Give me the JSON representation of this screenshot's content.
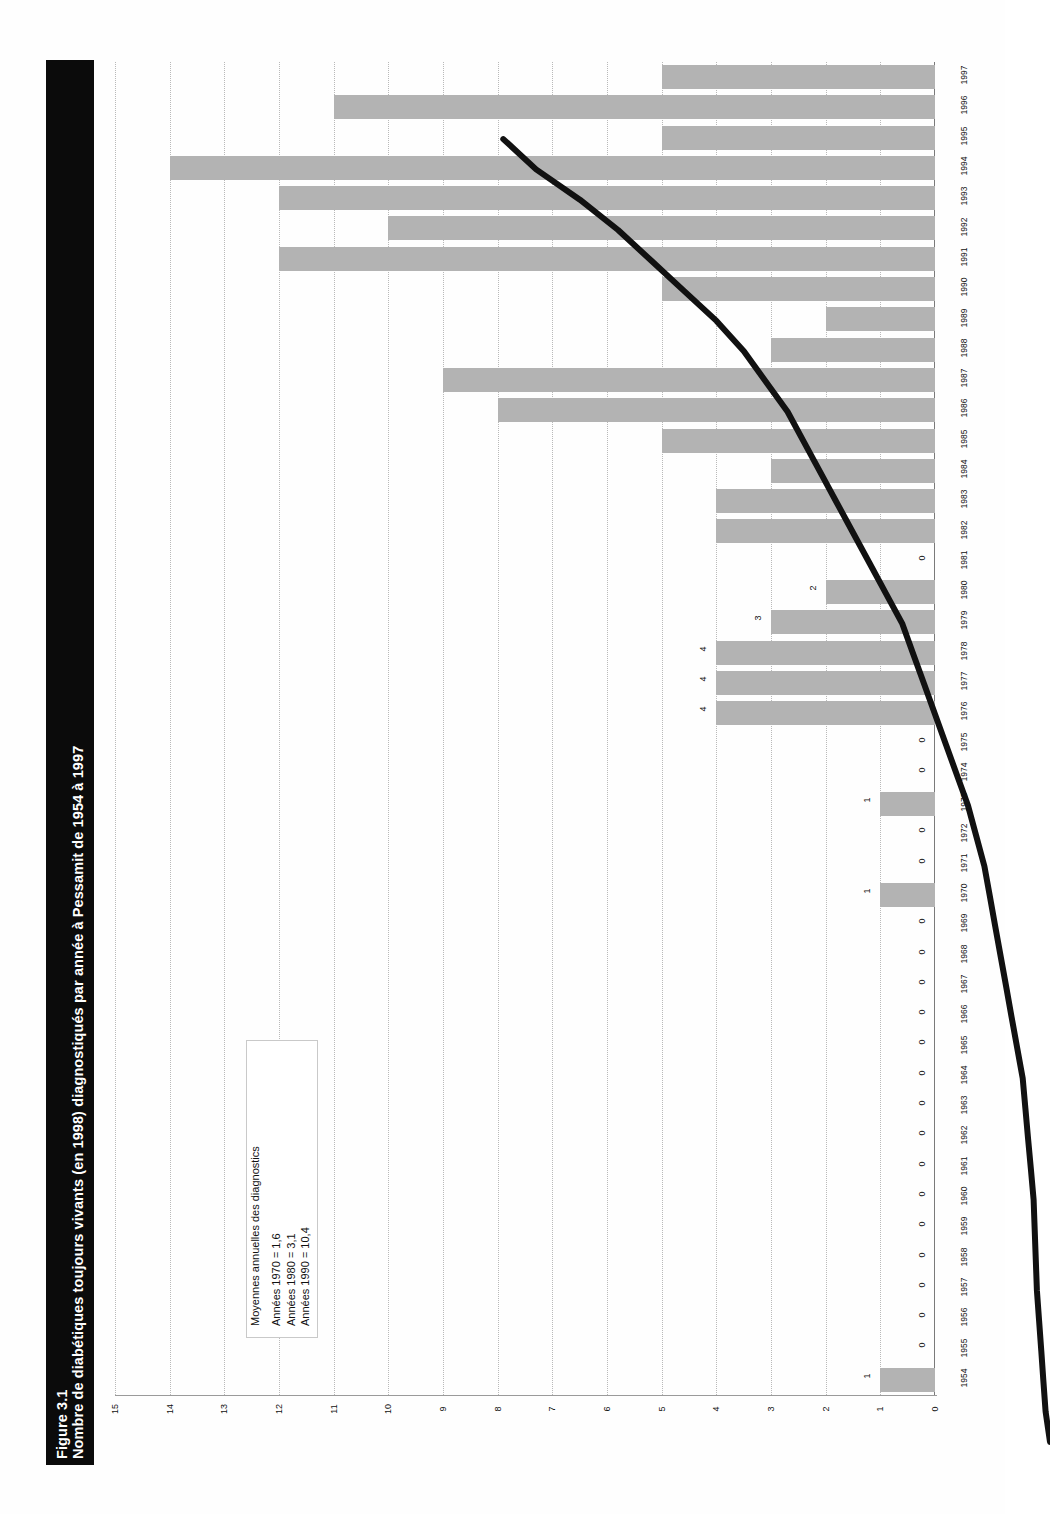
{
  "figure": {
    "number": "Figure 3.1",
    "caption": "Nombre de diabétiques toujours vivants (en 1998) diagnostiqués par année à Pessamit de 1954 à 1997"
  },
  "note": {
    "heading": "Moyennes annuelles des diagnostics",
    "lines": [
      "Années 1970 = 1,6",
      "Années 1980 = 3,1",
      "Années 1990 = 10,4"
    ]
  },
  "colors": {
    "bar": "#b3b3b3",
    "line": "#111111",
    "grid": "#b9b9b9",
    "title_band": "#0b0b0b",
    "title_text": "#ffffff"
  },
  "chart_data": {
    "type": "bar",
    "title": "Nombre de diabétiques toujours vivants (en 1998) diagnostiqués par année à Pessamit de 1954 à 1997",
    "xlabel": "",
    "ylabel": "",
    "orientation": "horizontal",
    "value_axis_ticks": [
      "15",
      "14",
      "13",
      "12",
      "11",
      "10",
      "9",
      "8",
      "7",
      "6",
      "5",
      "4",
      "3",
      "2",
      "1",
      "0"
    ],
    "value_axis_range": [
      0,
      15
    ],
    "grid": true,
    "legend": "none",
    "categories": [
      "1997",
      "1996",
      "1995",
      "1994",
      "1993",
      "1992",
      "1991",
      "1990",
      "1989",
      "1988",
      "1987",
      "1986",
      "1985",
      "1984",
      "1983",
      "1982",
      "1981",
      "1980",
      "1979",
      "1978",
      "1977",
      "1976",
      "1975",
      "1974",
      "1973",
      "1972",
      "1971",
      "1970",
      "1969",
      "1968",
      "1967",
      "1966",
      "1965",
      "1964",
      "1963",
      "1962",
      "1961",
      "1960",
      "1959",
      "1958",
      "1957",
      "1956",
      "1955",
      "1954"
    ],
    "values": [
      5,
      11,
      5,
      14,
      12,
      10,
      12,
      5,
      2,
      3,
      9,
      8,
      5,
      3,
      4,
      4,
      0,
      2,
      3,
      4,
      4,
      4,
      0,
      0,
      1,
      0,
      0,
      1,
      0,
      0,
      0,
      0,
      0,
      0,
      0,
      0,
      0,
      0,
      0,
      0,
      0,
      0,
      0,
      1
    ],
    "point_labels": [
      "",
      "",
      "",
      "",
      "",
      "",
      "",
      "",
      "",
      "",
      "",
      "",
      "",
      "",
      "",
      "",
      "0",
      "2",
      "3",
      "4",
      "4",
      "4",
      "0",
      "0",
      "1",
      "0",
      "0",
      "1",
      "0",
      "0",
      "0",
      "0",
      "0",
      "0",
      "0",
      "0",
      "0",
      "0",
      "0",
      "0",
      "0",
      "0",
      "0",
      "1"
    ],
    "series": [
      {
        "name": "Nombre de diabétiques toujours vivants",
        "type": "bar",
        "values": [
          5,
          11,
          5,
          14,
          12,
          10,
          12,
          5,
          2,
          3,
          9,
          8,
          5,
          3,
          4,
          4,
          0,
          2,
          3,
          4,
          4,
          4,
          0,
          0,
          1,
          0,
          0,
          1,
          0,
          0,
          0,
          0,
          0,
          0,
          0,
          0,
          0,
          0,
          0,
          0,
          0,
          0,
          0,
          1
        ]
      },
      {
        "name": "Courbe cumulative (tendance)",
        "type": "line",
        "values": [
          10.0,
          9.4,
          8.6,
          7.9,
          7.3,
          6.7,
          6.1,
          5.6,
          5.2,
          4.8,
          4.5,
          4.2,
          3.9,
          3.6,
          3.3,
          3.0,
          2.7,
          2.5,
          2.3,
          2.1,
          1.9,
          1.7,
          1.5,
          1.35,
          1.2,
          1.1,
          1.0,
          0.9,
          0.8,
          0.7,
          0.6,
          0.5,
          0.45,
          0.4,
          0.35,
          0.3,
          0.28,
          0.26,
          0.24,
          0.2,
          0.16,
          0.12,
          0.08,
          0.0
        ]
      }
    ]
  }
}
